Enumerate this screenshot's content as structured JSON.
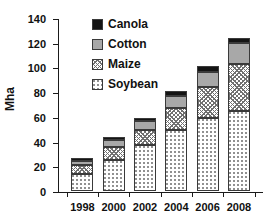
{
  "chart_data": {
    "type": "bar",
    "subtype": "stacked-bar",
    "title": "",
    "xlabel": "",
    "ylabel": "Mha",
    "ylim": [
      0,
      140
    ],
    "yticks": [
      0,
      20,
      40,
      60,
      80,
      100,
      120,
      140
    ],
    "grid": false,
    "legend_position": "top-left-inside",
    "categories": [
      "1998",
      "2000",
      "2002",
      "2004",
      "2006",
      "2008"
    ],
    "series": [
      {
        "name": "Soybean",
        "values": [
          14,
          25,
          37,
          49,
          59,
          65
        ]
      },
      {
        "name": "Maize",
        "values": [
          7,
          11,
          12,
          18,
          25,
          38
        ]
      },
      {
        "name": "Cotton",
        "values": [
          3,
          5,
          8,
          10,
          12,
          17
        ]
      },
      {
        "name": "Canola",
        "values": [
          3,
          3,
          2,
          4,
          5,
          4
        ]
      }
    ],
    "totals": [
      27,
      44,
      59,
      81,
      101,
      124
    ],
    "stack_order_bottom_to_top": [
      "Soybean",
      "Maize",
      "Cotton",
      "Canola"
    ],
    "colors": {
      "Canola": "#141414",
      "Cotton": "#a8a8a8",
      "Maize": "#ffffff",
      "Soybean": "#ffffff"
    },
    "patterns": {
      "Canola": "solid-black",
      "Cotton": "solid-gray",
      "Maize": "cross-hatch",
      "Soybean": "dotted-stipple"
    }
  },
  "axes": {
    "y_title": "Mha",
    "y_tick_labels": [
      "0",
      "20",
      "40",
      "60",
      "80",
      "100",
      "120",
      "140"
    ],
    "x_tick_labels": [
      "1998",
      "2000",
      "2002",
      "2004",
      "2006",
      "2008"
    ]
  },
  "legend": {
    "items": [
      {
        "label": "Canola",
        "pattern": "solid-black"
      },
      {
        "label": "Cotton",
        "pattern": "solid-gray"
      },
      {
        "label": "Maize",
        "pattern": "cross-hatch"
      },
      {
        "label": "Soybean",
        "pattern": "dotted-stipple"
      }
    ]
  }
}
